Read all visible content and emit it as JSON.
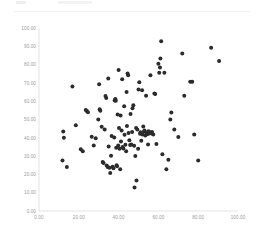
{
  "header": {
    "ghost_label": "",
    "ghost_value": ""
  },
  "chart_data": {
    "type": "scatter",
    "title": "",
    "subtitle": "",
    "xlabel": "",
    "ylabel": "",
    "xlim": [
      0,
      100
    ],
    "ylim": [
      0,
      100
    ],
    "grid": false,
    "legend": null,
    "marker": {
      "shape": "circle",
      "color": "#2b2b2b",
      "size": 2.0
    },
    "xticks": [
      0,
      20,
      40,
      60,
      80,
      100
    ],
    "xticklabels": [
      "0.00",
      "20.00",
      "40.00",
      "60.00",
      "80.00",
      "100.00"
    ],
    "yticks": [
      0,
      10,
      20,
      30,
      40,
      50,
      60,
      70,
      80,
      90,
      100
    ],
    "yticklabels": [
      "0.00",
      "10.00",
      "20.00",
      "30.00",
      "40.00",
      "50.00",
      "60.00",
      "70.00",
      "80.00",
      "90.00",
      "100.00"
    ],
    "series": [
      {
        "name": "points",
        "points": [
          [
            11.8,
            27.6
          ],
          [
            12.2,
            43.4
          ],
          [
            12.5,
            40.0
          ],
          [
            14.0,
            24.0
          ],
          [
            16.8,
            68.0
          ],
          [
            18.5,
            46.8
          ],
          [
            21.0,
            33.8
          ],
          [
            22.0,
            32.6
          ],
          [
            23.5,
            55.2
          ],
          [
            24.0,
            54.6
          ],
          [
            24.6,
            54.0
          ],
          [
            26.5,
            40.6
          ],
          [
            27.5,
            35.8
          ],
          [
            28.5,
            39.8
          ],
          [
            29.8,
            50.0
          ],
          [
            30.2,
            69.2
          ],
          [
            30.5,
            55.6
          ],
          [
            30.8,
            54.8
          ],
          [
            31.5,
            46.0
          ],
          [
            32.0,
            26.8
          ],
          [
            32.4,
            26.2
          ],
          [
            33.0,
            44.6
          ],
          [
            33.4,
            62.8
          ],
          [
            33.8,
            61.8
          ],
          [
            34.0,
            24.8
          ],
          [
            34.5,
            24.0
          ],
          [
            34.8,
            72.4
          ],
          [
            35.0,
            35.2
          ],
          [
            35.4,
            23.6
          ],
          [
            35.8,
            20.8
          ],
          [
            36.2,
            30.2
          ],
          [
            36.5,
            41.0
          ],
          [
            37.0,
            24.2
          ],
          [
            37.4,
            23.4
          ],
          [
            37.8,
            40.2
          ],
          [
            38.0,
            60.4
          ],
          [
            38.2,
            60.8
          ],
          [
            38.4,
            61.2
          ],
          [
            38.6,
            60.2
          ],
          [
            38.8,
            34.6
          ],
          [
            39.0,
            25.0
          ],
          [
            39.2,
            24.4
          ],
          [
            39.5,
            52.8
          ],
          [
            39.8,
            35.8
          ],
          [
            40.0,
            77.0
          ],
          [
            40.2,
            45.4
          ],
          [
            40.5,
            34.0
          ],
          [
            40.8,
            22.8
          ],
          [
            41.0,
            52.2
          ],
          [
            41.2,
            38.0
          ],
          [
            41.5,
            44.0
          ],
          [
            41.8,
            72.0
          ],
          [
            42.0,
            35.0
          ],
          [
            42.4,
            34.2
          ],
          [
            42.8,
            57.2
          ],
          [
            43.0,
            41.6
          ],
          [
            43.4,
            36.2
          ],
          [
            43.8,
            32.6
          ],
          [
            44.0,
            65.0
          ],
          [
            44.2,
            46.4
          ],
          [
            44.5,
            75.2
          ],
          [
            44.8,
            74.2
          ],
          [
            45.0,
            42.6
          ],
          [
            45.4,
            38.6
          ],
          [
            45.8,
            36.0
          ],
          [
            46.0,
            53.0
          ],
          [
            46.4,
            36.4
          ],
          [
            46.8,
            43.2
          ],
          [
            47.0,
            56.2
          ],
          [
            47.4,
            57.8
          ],
          [
            47.8,
            35.6
          ],
          [
            48.0,
            12.8
          ],
          [
            48.4,
            30.0
          ],
          [
            48.8,
            45.4
          ],
          [
            49.0,
            16.6
          ],
          [
            49.4,
            44.6
          ],
          [
            49.8,
            34.0
          ],
          [
            50.0,
            66.4
          ],
          [
            50.4,
            70.4
          ],
          [
            50.8,
            42.2
          ],
          [
            51.0,
            43.0
          ],
          [
            51.4,
            38.4
          ],
          [
            51.8,
            66.0
          ],
          [
            52.0,
            41.8
          ],
          [
            52.4,
            46.2
          ],
          [
            52.8,
            43.4
          ],
          [
            53.0,
            44.0
          ],
          [
            53.4,
            41.2
          ],
          [
            53.8,
            63.0
          ],
          [
            54.0,
            42.8
          ],
          [
            54.4,
            42.0
          ],
          [
            54.8,
            36.4
          ],
          [
            55.0,
            43.6
          ],
          [
            55.4,
            42.4
          ],
          [
            55.8,
            43.0
          ],
          [
            56.0,
            74.2
          ],
          [
            56.4,
            42.6
          ],
          [
            56.8,
            43.2
          ],
          [
            57.0,
            42.2
          ],
          [
            57.4,
            41.8
          ],
          [
            58.0,
            64.2
          ],
          [
            58.4,
            64.0
          ],
          [
            59.0,
            36.6
          ],
          [
            60.0,
            80.4
          ],
          [
            60.4,
            75.6
          ],
          [
            60.8,
            78.4
          ],
          [
            61.0,
            83.4
          ],
          [
            61.4,
            92.8
          ],
          [
            62.0,
            31.0
          ],
          [
            63.0,
            75.6
          ],
          [
            64.0,
            22.8
          ],
          [
            65.0,
            28.0
          ],
          [
            66.0,
            50.0
          ],
          [
            66.5,
            53.8
          ],
          [
            68.0,
            44.6
          ],
          [
            70.0,
            40.4
          ],
          [
            72.0,
            86.0
          ],
          [
            73.0,
            63.0
          ],
          [
            76.0,
            70.6
          ],
          [
            77.0,
            70.6
          ],
          [
            78.0,
            41.8
          ],
          [
            80.0,
            27.6
          ],
          [
            86.5,
            89.2
          ],
          [
            90.5,
            82.0
          ]
        ]
      }
    ]
  }
}
